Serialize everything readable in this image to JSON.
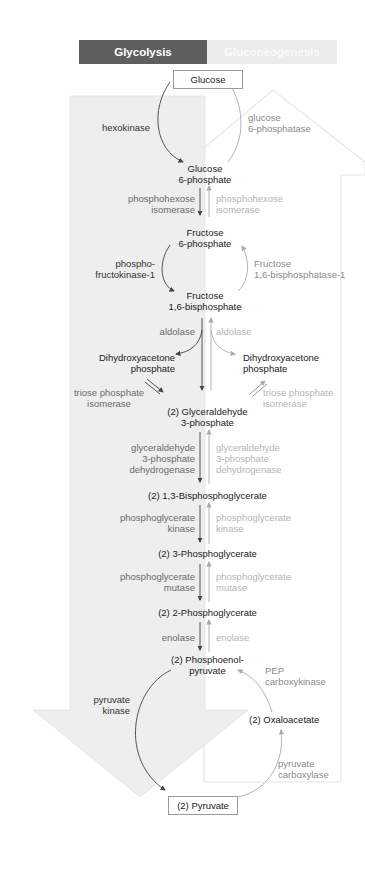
{
  "header": {
    "glycolysis_label": "Glycolysis",
    "gluconeogenesis_label": "Gluconeogenesis"
  },
  "colors": {
    "glycolysis_header": "#5e5e5e",
    "gluconeogenesis_header": "#ececec",
    "glycolysis_arrow_fill": "#eeeeee",
    "gluconeogenesis_arrow_outline": "#e6e6e6"
  },
  "metabolites": {
    "glucose": "Glucose",
    "g6p_1": "Glucose",
    "g6p_2": "6-phosphate",
    "f6p_1": "Fructose",
    "f6p_2": "6-phosphate",
    "f16bp_1": "Fructose",
    "f16bp_2": "1,6-bisphosphate",
    "dhap_left_1": "Dihydroxyacetone",
    "dhap_left_2": "phosphate",
    "dhap_right_1": "Dihydroxyacetone",
    "dhap_right_2": "phosphate",
    "g3p_1": "(2) Glyceraldehyde",
    "g3p_2": "3-phosphate",
    "bpg13": "(2) 1,3-Bisphosphoglycerate",
    "pg3": "(2) 3-Phosphoglycerate",
    "pg2": "(2) 2-Phosphoglycerate",
    "pep_1": "(2) Phosphoenol-",
    "pep_2": "pyruvate",
    "oxaloacetate": "(2) Oxaloacetate",
    "pyruvate": "(2) Pyruvate"
  },
  "glycolysis_enzymes": {
    "hexokinase": "hexokinase",
    "phi_1": "phosphohexose",
    "phi_2": "isomerase",
    "pfk_1": "phospho-",
    "pfk_2": "fructokinase-1",
    "aldolase": "aldolase",
    "tpi_1": "triose phosphate",
    "tpi_2": "isomerase",
    "gapdh_1": "glyceraldehyde",
    "gapdh_2": "3-phosphate",
    "gapdh_3": "dehydrogenase",
    "pgk_1": "phosphoglycerate",
    "pgk_2": "kinase",
    "pgm_1": "phosphoglycerate",
    "pgm_2": "mutase",
    "enolase": "enolase",
    "pk_1": "pyruvate",
    "pk_2": "kinase"
  },
  "gluconeogenesis_enzymes": {
    "g6pase_1": "glucose",
    "g6pase_2": "6-phosphatase",
    "phi_1": "phosphohexose",
    "phi_2": "isomerase",
    "fbpase_1": "Fructose",
    "fbpase_2": "1,6-bisphosphatase-1",
    "aldolase": "aldolase",
    "tpi_1": "triose phosphate",
    "tpi_2": "isomerase",
    "gapdh_1": "glyceraldehyde",
    "gapdh_2": "3-phosphate",
    "gapdh_3": "dehydrogenase",
    "pgk_1": "phosphoglycerate",
    "pgk_2": "kinase",
    "pgm_1": "phosphoglycerate",
    "pgm_2": "mutase",
    "enolase": "enolase",
    "pepck_1": "PEP",
    "pepck_2": "carboxykinase",
    "pc_1": "pyruvate",
    "pc_2": "carboxylase"
  }
}
